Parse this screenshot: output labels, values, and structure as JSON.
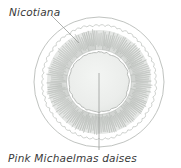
{
  "diagram": {
    "kind": "garden-planting-plan",
    "shape": "circular-bed",
    "labels": {
      "outer_ring": "Nicotiana",
      "inner_ring": "Pink Michaelmas daises"
    },
    "leader_lines": [
      {
        "name": "nicotiana-leader",
        "from": [
          52,
          16
        ],
        "to": [
          79,
          43
        ],
        "target": "outer-ring"
      },
      {
        "name": "daisies-leader",
        "from": [
          99,
          73
        ],
        "to": [
          99,
          150
        ],
        "target": "inner-ring"
      }
    ],
    "geometry": {
      "center": [
        99,
        82
      ],
      "outer_circle_radius": 65,
      "scallop_ring_inner_radius": 56,
      "petal_ring_outer_radius": 55,
      "petal_ring_inner_radius": 31,
      "center_disc_radius": 30,
      "scallop_count": 58,
      "petal_cluster_count": 30
    },
    "colors": {
      "background": "#ffffff",
      "outline": "#b9bcb9",
      "scallop_line": "#c2c5c2",
      "petal_fill": "#cdd0cd",
      "petal_fill_light": "#dcdfdc",
      "petal_stroke": "#aeb2ae",
      "center_fill": "#eceeec",
      "center_stroke": "#b5b9b5",
      "leader_line": "#9a9d9a",
      "text": "#3a3a3a"
    }
  }
}
